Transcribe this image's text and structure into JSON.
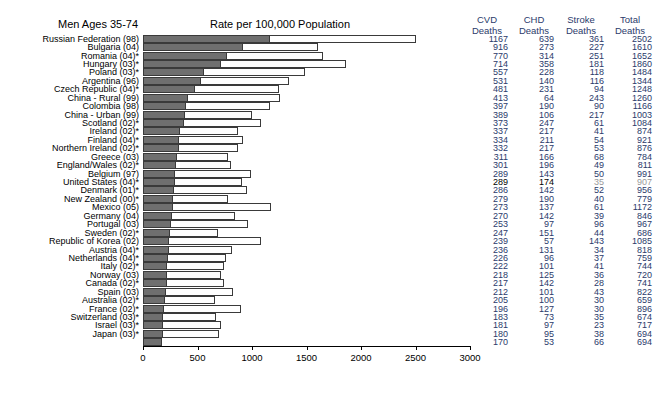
{
  "titles": {
    "left": "Men Ages 35-74",
    "center": "Rate per 100,000 Population"
  },
  "columns": [
    {
      "line1": "CVD",
      "line2": "Deaths"
    },
    {
      "line1": "CHD",
      "line2": "Deaths"
    },
    {
      "line1": "Stroke",
      "line2": "Deaths"
    },
    {
      "line1": "Total",
      "line2": "Deaths"
    }
  ],
  "chart_data": {
    "type": "bar",
    "title": "Rate per 100,000 Population",
    "subtitle": "Men Ages 35-74",
    "xlabel": "",
    "ylabel": "",
    "xlim": [
      0,
      3000
    ],
    "xticks": [
      0,
      500,
      1000,
      1500,
      2000,
      2500,
      3000
    ],
    "grid": false,
    "orientation": "horizontal",
    "series": [
      {
        "name": "CVD Deaths",
        "color": "#6f6f6f"
      },
      {
        "name": "Total Deaths",
        "color": "#ffffff"
      }
    ],
    "categories": [
      "Russian Federation (98)",
      "Bulgaria (04)",
      "Romania (04)*",
      "Hungary (03)*",
      "Poland (03)*",
      "Argentina (96)",
      "Czech Republic (04)*",
      "China - Rural (99)",
      "Colombia (98)",
      "China - Urban (99)",
      "Scotland (02)*",
      "Ireland (02)*",
      "Finland (04)*",
      "Northern Ireland (02)*",
      "Greece (03)",
      "England/Wales (02)*",
      "Belgium (97)",
      "United States (04)*",
      "Denmark (01)*",
      "New Zealand (00)*",
      "Mexico (05)",
      "Germany (04)",
      "Portugal (03)",
      "Sweden (02)*",
      "Republic of Korea (02)",
      "Austria (04)*",
      "Netherlands (04)*",
      "Italy (02)*",
      "Norway (03)",
      "Canada (02)*",
      "Spain (03)",
      "Australia (02)*",
      "France (02)*",
      "Switzerland (03)*",
      "Israel (03)*",
      "Japan (03)*"
    ],
    "cvd_deaths": [
      1167,
      916,
      770,
      714,
      557,
      531,
      481,
      413,
      397,
      389,
      373,
      337,
      334,
      332,
      311,
      301,
      289,
      289,
      286,
      279,
      273,
      270,
      253,
      247,
      239,
      236,
      226,
      222,
      218,
      217,
      212,
      205,
      196,
      183,
      181,
      180,
      170
    ],
    "chd_deaths": [
      639,
      273,
      314,
      358,
      228,
      140,
      231,
      64,
      190,
      106,
      247,
      217,
      211,
      217,
      166,
      196,
      143,
      174,
      142,
      190,
      137,
      142,
      97,
      151,
      57,
      131,
      96,
      101,
      125,
      142,
      101,
      100,
      127,
      73,
      97,
      95,
      53
    ],
    "stroke_deaths": [
      361,
      227,
      251,
      181,
      118,
      116,
      94,
      243,
      90,
      217,
      61,
      41,
      54,
      53,
      68,
      49,
      50,
      35,
      52,
      40,
      61,
      39,
      96,
      44,
      143,
      34,
      37,
      41,
      36,
      28,
      43,
      30,
      30,
      35,
      23,
      38,
      66
    ],
    "total_deaths": [
      2502,
      1610,
      1652,
      1860,
      1484,
      1344,
      1248,
      1260,
      1166,
      1003,
      1084,
      874,
      921,
      876,
      784,
      811,
      991,
      907,
      956,
      779,
      1172,
      846,
      967,
      686,
      1085,
      818,
      759,
      744,
      720,
      741,
      822,
      659,
      896,
      674,
      717,
      694
    ],
    "note": "Bars show Total Deaths (open) with CVD Deaths (filled grey) overlaid from zero."
  },
  "rows": [
    {
      "label": "Russian Federation (98)",
      "cvd": "1167",
      "chd": "639",
      "stroke": "361",
      "total": "2502",
      "cvd_style": "",
      "chd_style": "",
      "stroke_style": "",
      "total_style": ""
    },
    {
      "label": "Bulgaria (04)",
      "cvd": "916",
      "chd": "273",
      "stroke": "227",
      "total": "1610",
      "cvd_style": "",
      "chd_style": "",
      "stroke_style": "",
      "total_style": ""
    },
    {
      "label": "Romania (04)*",
      "cvd": "770",
      "chd": "314",
      "stroke": "251",
      "total": "1652",
      "cvd_style": "",
      "chd_style": "",
      "stroke_style": "",
      "total_style": ""
    },
    {
      "label": "Hungary (03)*",
      "cvd": "714",
      "chd": "358",
      "stroke": "181",
      "total": "1860",
      "cvd_style": "",
      "chd_style": "",
      "stroke_style": "",
      "total_style": ""
    },
    {
      "label": "Poland (03)*",
      "cvd": "557",
      "chd": "228",
      "stroke": "118",
      "total": "1484",
      "cvd_style": "",
      "chd_style": "",
      "stroke_style": "",
      "total_style": ""
    },
    {
      "label": "Argentina (96)",
      "cvd": "531",
      "chd": "140",
      "stroke": "116",
      "total": "1344",
      "cvd_style": "",
      "chd_style": "",
      "stroke_style": "",
      "total_style": ""
    },
    {
      "label": "Czech Republic (04)*",
      "cvd": "481",
      "chd": "231",
      "stroke": "94",
      "total": "1248",
      "cvd_style": "",
      "chd_style": "",
      "stroke_style": "",
      "total_style": ""
    },
    {
      "label": "China - Rural (99)",
      "cvd": "413",
      "chd": "64",
      "stroke": "243",
      "total": "1260",
      "cvd_style": "",
      "chd_style": "",
      "stroke_style": "",
      "total_style": ""
    },
    {
      "label": "Colombia (98)",
      "cvd": "397",
      "chd": "190",
      "stroke": "90",
      "total": "1166",
      "cvd_style": "",
      "chd_style": "",
      "stroke_style": "",
      "total_style": ""
    },
    {
      "label": "China - Urban (99)",
      "cvd": "389",
      "chd": "106",
      "stroke": "217",
      "total": "1003",
      "cvd_style": "",
      "chd_style": "",
      "stroke_style": "",
      "total_style": ""
    },
    {
      "label": "Scotland (02)*",
      "cvd": "373",
      "chd": "247",
      "stroke": "61",
      "total": "1084",
      "cvd_style": "",
      "chd_style": "",
      "stroke_style": "",
      "total_style": ""
    },
    {
      "label": "Ireland (02)*",
      "cvd": "337",
      "chd": "217",
      "stroke": "41",
      "total": "874",
      "cvd_style": "",
      "chd_style": "",
      "stroke_style": "",
      "total_style": ""
    },
    {
      "label": "Finland (04)*",
      "cvd": "334",
      "chd": "211",
      "stroke": "54",
      "total": "921",
      "cvd_style": "",
      "chd_style": "",
      "stroke_style": "",
      "total_style": ""
    },
    {
      "label": "Northern Ireland (02)*",
      "cvd": "332",
      "chd": "217",
      "stroke": "53",
      "total": "876",
      "cvd_style": "",
      "chd_style": "",
      "stroke_style": "",
      "total_style": ""
    },
    {
      "label": "Greece (03)",
      "cvd": "311",
      "chd": "166",
      "stroke": "68",
      "total": "784",
      "cvd_style": "",
      "chd_style": "",
      "stroke_style": "",
      "total_style": ""
    },
    {
      "label": "England/Wales (02)*",
      "cvd": "301",
      "chd": "196",
      "stroke": "49",
      "total": "811",
      "cvd_style": "",
      "chd_style": "",
      "stroke_style": "",
      "total_style": ""
    },
    {
      "label": "Belgium (97)",
      "cvd": "289",
      "chd": "143",
      "stroke": "50",
      "total": "991",
      "cvd_style": "",
      "chd_style": "",
      "stroke_style": "",
      "total_style": ""
    },
    {
      "label": "United States (04)*",
      "cvd": "289",
      "chd": "174",
      "stroke": "35",
      "total": "907",
      "cvd_style": "dark",
      "chd_style": "dark",
      "stroke_style": "grey",
      "total_style": "grey"
    },
    {
      "label": "Denmark (01)*",
      "cvd": "286",
      "chd": "142",
      "stroke": "52",
      "total": "956",
      "cvd_style": "",
      "chd_style": "",
      "stroke_style": "",
      "total_style": ""
    },
    {
      "label": "New Zealand (00)*",
      "cvd": "279",
      "chd": "190",
      "stroke": "40",
      "total": "779",
      "cvd_style": "",
      "chd_style": "",
      "stroke_style": "",
      "total_style": ""
    },
    {
      "label": "Mexico (05)",
      "cvd": "273",
      "chd": "137",
      "stroke": "61",
      "total": "1172",
      "cvd_style": "",
      "chd_style": "",
      "stroke_style": "",
      "total_style": ""
    },
    {
      "label": "Germany (04)",
      "cvd": "270",
      "chd": "142",
      "stroke": "39",
      "total": "846",
      "cvd_style": "",
      "chd_style": "",
      "stroke_style": "",
      "total_style": ""
    },
    {
      "label": "Portugal (03)",
      "cvd": "253",
      "chd": "97",
      "stroke": "96",
      "total": "967",
      "cvd_style": "",
      "chd_style": "",
      "stroke_style": "",
      "total_style": ""
    },
    {
      "label": "Sweden (02)*",
      "cvd": "247",
      "chd": "151",
      "stroke": "44",
      "total": "686",
      "cvd_style": "",
      "chd_style": "",
      "stroke_style": "",
      "total_style": ""
    },
    {
      "label": "Republic of Korea (02)",
      "cvd": "239",
      "chd": "57",
      "stroke": "143",
      "total": "1085",
      "cvd_style": "",
      "chd_style": "",
      "stroke_style": "",
      "total_style": ""
    },
    {
      "label": "Austria (04)*",
      "cvd": "236",
      "chd": "131",
      "stroke": "34",
      "total": "818",
      "cvd_style": "",
      "chd_style": "",
      "stroke_style": "",
      "total_style": ""
    },
    {
      "label": "Netherlands (04)*",
      "cvd": "226",
      "chd": "96",
      "stroke": "37",
      "total": "759",
      "cvd_style": "",
      "chd_style": "",
      "stroke_style": "",
      "total_style": ""
    },
    {
      "label": "Italy (02)*",
      "cvd": "222",
      "chd": "101",
      "stroke": "41",
      "total": "744",
      "cvd_style": "",
      "chd_style": "",
      "stroke_style": "",
      "total_style": ""
    },
    {
      "label": "Norway (03)",
      "cvd": "218",
      "chd": "125",
      "stroke": "36",
      "total": "720",
      "cvd_style": "",
      "chd_style": "",
      "stroke_style": "",
      "total_style": ""
    },
    {
      "label": "Canada (02)*",
      "cvd": "217",
      "chd": "142",
      "stroke": "28",
      "total": "741",
      "cvd_style": "",
      "chd_style": "",
      "stroke_style": "",
      "total_style": ""
    },
    {
      "label": "Spain (03)",
      "cvd": "212",
      "chd": "101",
      "stroke": "43",
      "total": "822",
      "cvd_style": "",
      "chd_style": "",
      "stroke_style": "",
      "total_style": ""
    },
    {
      "label": "Australia (02)*",
      "cvd": "205",
      "chd": "100",
      "stroke": "30",
      "total": "659",
      "cvd_style": "",
      "chd_style": "",
      "stroke_style": "",
      "total_style": ""
    },
    {
      "label": "France (02)*",
      "cvd": "196",
      "chd": "127",
      "stroke": "30",
      "total": "896",
      "cvd_style": "",
      "chd_style": "",
      "stroke_style": "",
      "total_style": ""
    },
    {
      "label": "Switzerland (03)*",
      "cvd": "183",
      "chd": "73",
      "stroke": "35",
      "total": "674",
      "cvd_style": "",
      "chd_style": "",
      "stroke_style": "",
      "total_style": ""
    },
    {
      "label": "Israel (03)*",
      "cvd": "181",
      "chd": "97",
      "stroke": "23",
      "total": "717",
      "cvd_style": "",
      "chd_style": "",
      "stroke_style": "",
      "total_style": ""
    },
    {
      "label": "Japan (03)*",
      "cvd": "180",
      "chd": "95",
      "stroke": "38",
      "total": "694",
      "cvd_style": "",
      "chd_style": "",
      "stroke_style": "",
      "total_style": ""
    },
    {
      "label": "",
      "cvd": "170",
      "chd": "53",
      "stroke": "66",
      "total": "694",
      "cvd_style": "",
      "chd_style": "",
      "stroke_style": "",
      "total_style": ""
    }
  ],
  "axis": {
    "ticks": [
      "0",
      "500",
      "1000",
      "1500",
      "2000",
      "2500",
      "3000"
    ]
  }
}
